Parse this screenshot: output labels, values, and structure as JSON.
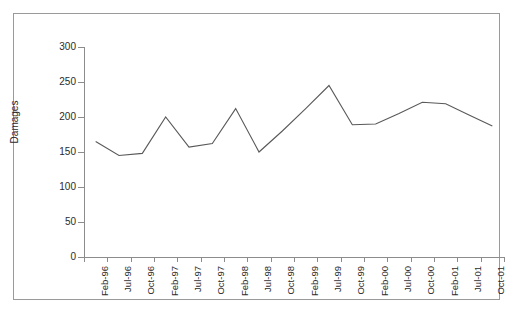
{
  "chart_data": {
    "type": "line",
    "title": "",
    "xlabel": "",
    "ylabel": "Damages",
    "ylim": [
      0,
      300
    ],
    "yticks": [
      0,
      50,
      100,
      150,
      200,
      250,
      300
    ],
    "grid": false,
    "legend": false,
    "categories": [
      "Feb-96",
      "Jul-96",
      "Oct-96",
      "Feb-97",
      "Jul-97",
      "Oct-97",
      "Feb-98",
      "Jul-98",
      "Oct-98",
      "Feb-99",
      "Jul-99",
      "Oct-99",
      "Feb-00",
      "Jul-00",
      "Oct-00",
      "Feb-01",
      "Jul-01",
      "Oct-01"
    ],
    "values": [
      165,
      145,
      148,
      200,
      157,
      162,
      212,
      150,
      180,
      212,
      245,
      189,
      190,
      205,
      221,
      219,
      203,
      187
    ],
    "series_color": "#595959",
    "axis_color": "#8c8c8c",
    "frame_color": "#9a9a9a",
    "text_color": "#2b2b2b"
  }
}
